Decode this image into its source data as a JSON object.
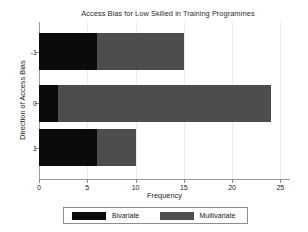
{
  "chart_data": {
    "type": "bar",
    "orientation": "horizontal",
    "stacked": true,
    "title": "Access Bias for Low Skilled in Training Programmes",
    "xlabel": "Frequency",
    "ylabel": "Direction of Access Bias",
    "categories": [
      "-1",
      "0",
      "1"
    ],
    "series": [
      {
        "name": "Bivariate",
        "color": "#0b0b0b",
        "values": [
          6,
          2,
          6
        ]
      },
      {
        "name": "Multivariate",
        "color": "#4d4d4d",
        "values": [
          9,
          22,
          4
        ]
      }
    ],
    "totals": [
      15,
      24,
      10
    ],
    "xlim": [
      0,
      26
    ],
    "xticks": [
      "0",
      "5",
      "10",
      "15",
      "20",
      "25"
    ],
    "xtick_values": [
      0,
      5,
      10,
      15,
      20,
      25
    ],
    "yticks": [
      "-1",
      "0",
      "1"
    ],
    "grid": "vertical-light",
    "legend_position": "bottom-outside"
  },
  "legend": {
    "entries": [
      {
        "label": "Bivariate",
        "color": "#0b0b0b"
      },
      {
        "label": "Multivariate",
        "color": "#4d4d4d"
      }
    ]
  }
}
